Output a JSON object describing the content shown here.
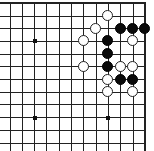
{
  "board": {
    "view": "top-right corner",
    "columns": 12,
    "rows": 12,
    "origin_x": 10,
    "origin_y": 3.3,
    "spacing_x": 12.3,
    "spacing_y": 12.7,
    "right_edge": true,
    "top_edge": true,
    "colors": {
      "line": "#222222",
      "black": "#0a0a0a",
      "white": "#ffffff",
      "background": "#ffffff"
    },
    "star_points": [
      {
        "col": 2,
        "row": 3
      },
      {
        "col": 2,
        "row": 9
      },
      {
        "col": 8,
        "row": 9
      }
    ],
    "stones": [
      {
        "color": "white",
        "col": 8,
        "row": 1
      },
      {
        "color": "white",
        "col": 7,
        "row": 2
      },
      {
        "color": "black",
        "col": 9,
        "row": 2
      },
      {
        "color": "black",
        "col": 10,
        "row": 2
      },
      {
        "color": "black",
        "col": 11,
        "row": 2
      },
      {
        "color": "white",
        "col": 6,
        "row": 3
      },
      {
        "color": "black",
        "col": 8,
        "row": 3
      },
      {
        "color": "white",
        "col": 10,
        "row": 3
      },
      {
        "color": "black",
        "col": 8,
        "row": 4
      },
      {
        "color": "white",
        "col": 6,
        "row": 5
      },
      {
        "color": "black",
        "col": 8,
        "row": 5
      },
      {
        "color": "white",
        "col": 9,
        "row": 5
      },
      {
        "color": "white",
        "col": 10,
        "row": 5
      },
      {
        "color": "white",
        "col": 8,
        "row": 6
      },
      {
        "color": "black",
        "col": 9,
        "row": 6
      },
      {
        "color": "black",
        "col": 10,
        "row": 6
      },
      {
        "color": "white",
        "col": 8,
        "row": 7
      },
      {
        "color": "white",
        "col": 10,
        "row": 7
      }
    ]
  }
}
